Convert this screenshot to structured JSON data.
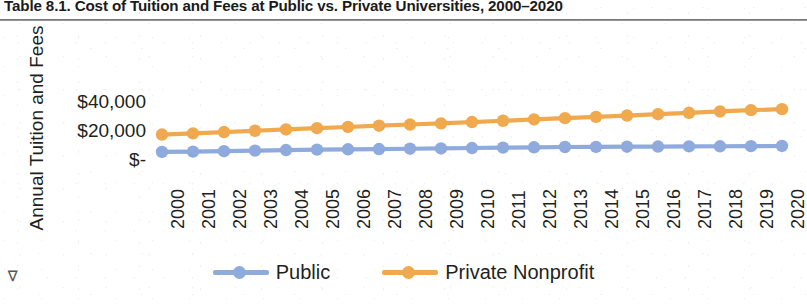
{
  "figure": {
    "title": "Table 8.1. Cost of Tuition and Fees at Public vs. Private Universities, 2000–2020",
    "scan_mark": "⊲"
  },
  "colors": {
    "public": "#8FAADC",
    "private": "#F0A94C",
    "text": "#231f20",
    "rule": "#6d6d6d",
    "background": "#ffffff"
  },
  "axes": {
    "y_title": "Annual Tuition and Fees",
    "y_ticks": [
      "$40,000",
      "$20,000",
      "$-"
    ],
    "x_title": ""
  },
  "legend": {
    "position": "bottom",
    "items": [
      {
        "label": "Public",
        "color_key": "public",
        "icon": "line-marker-icon"
      },
      {
        "label": "Private Nonprofit",
        "color_key": "private",
        "icon": "line-marker-icon"
      }
    ]
  },
  "chart_data": {
    "type": "line",
    "title": "Table 8.1. Cost of Tuition and Fees at Public vs. Private Universities, 2000–2020",
    "xlabel": "",
    "ylabel": "Annual Tuition and Fees",
    "ylim": [
      0,
      50000
    ],
    "yticks": [
      0,
      20000,
      40000
    ],
    "ytick_labels": [
      "$-",
      "$20,000",
      "$40,000"
    ],
    "grid": false,
    "legend_position": "bottom",
    "categories": [
      "2000",
      "2001",
      "2002",
      "2003",
      "2004",
      "2005",
      "2006",
      "2007",
      "2008",
      "2009",
      "2010",
      "2011",
      "2012",
      "2013",
      "2014",
      "2015",
      "2016",
      "2017",
      "2018",
      "2019",
      "2020"
    ],
    "series": [
      {
        "name": "Public",
        "color": "#8FAADC",
        "marker": "circle",
        "values": [
          3500,
          3700,
          4000,
          4400,
          4800,
          5100,
          5300,
          5500,
          5700,
          5900,
          6200,
          6500,
          6700,
          6900,
          7000,
          7100,
          7200,
          7300,
          7400,
          7500,
          7600
        ]
      },
      {
        "name": "Private Nonprofit",
        "color": "#F0A94C",
        "marker": "circle",
        "values": [
          15500,
          16300,
          17200,
          18100,
          19000,
          19900,
          20700,
          21600,
          22400,
          23200,
          24100,
          25000,
          25900,
          26800,
          27700,
          28600,
          29500,
          30500,
          31400,
          32300,
          33000
        ]
      }
    ]
  }
}
